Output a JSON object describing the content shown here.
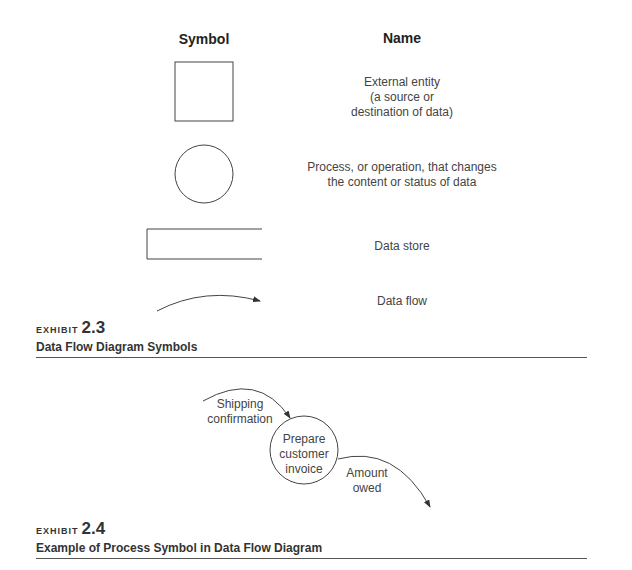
{
  "exhibit_2_3": {
    "tag": "EXHIBIT",
    "number": "2.3",
    "caption": "Data Flow Diagram Symbols",
    "headers": {
      "symbol": "Symbol",
      "name": "Name"
    },
    "rows": [
      {
        "symbol": "square",
        "name": "External entity\n(a source or\ndestination of data)"
      },
      {
        "symbol": "circle",
        "name": "Process, or operation, that changes\nthe content or status of data"
      },
      {
        "symbol": "open-rectangle",
        "name": "Data store"
      },
      {
        "symbol": "arrow",
        "name": "Data flow"
      }
    ]
  },
  "exhibit_2_4": {
    "tag": "EXHIBIT",
    "number": "2.4",
    "caption": "Example of Process Symbol in Data Flow Diagram",
    "process_label": "Prepare\ncustomer\ninvoice",
    "input_flow_label": "Shipping\nconfirmation",
    "output_flow_label": "Amount\nowed"
  },
  "colors": {
    "line": "#444444",
    "text": "#333333",
    "rule": "#555555"
  }
}
